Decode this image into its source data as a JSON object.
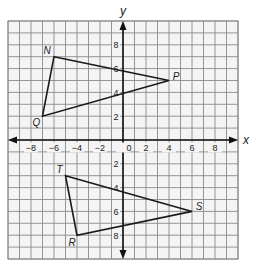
{
  "chart_data": {
    "type": "scatter",
    "title": "",
    "xlabel": "x",
    "ylabel": "y",
    "xlim": [
      -10,
      10
    ],
    "ylim": [
      -10,
      10
    ],
    "grid": true,
    "x_ticks": [
      -8,
      -6,
      -4,
      -2,
      0,
      2,
      4,
      6,
      8
    ],
    "y_ticks": [
      8,
      6,
      4,
      2,
      -2,
      -4,
      -6,
      -8
    ],
    "x_tick_labels": [
      "−8",
      "−6",
      "−4",
      "−2",
      "0",
      "2",
      "4",
      "6",
      "8"
    ],
    "y_tick_labels": [
      "8",
      "6",
      "4",
      "2",
      "2",
      "4",
      "6",
      "8"
    ],
    "shapes": [
      {
        "name": "Triangle NPQ",
        "vertices": [
          {
            "label": "N",
            "x": -6,
            "y": 7
          },
          {
            "label": "P",
            "x": 4,
            "y": 5
          },
          {
            "label": "Q",
            "x": -7,
            "y": 2
          }
        ]
      },
      {
        "name": "Triangle TSR",
        "vertices": [
          {
            "label": "T",
            "x": -5,
            "y": -3
          },
          {
            "label": "S",
            "x": 6,
            "y": -6
          },
          {
            "label": "R",
            "x": -4,
            "y": -8
          }
        ]
      }
    ]
  },
  "colors": {
    "grid": "#8a8a8a",
    "axis": "#111111",
    "shape": "#1a1a1a",
    "background": "#ffffff"
  }
}
